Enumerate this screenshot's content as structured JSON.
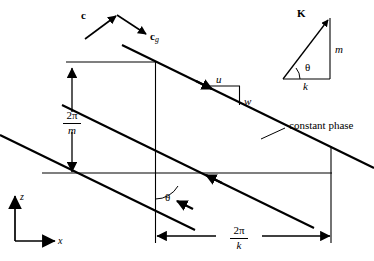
{
  "figure": {
    "background_color": "#ffffff",
    "line_color": "#000000",
    "width": 374,
    "height": 261
  },
  "labels": {
    "phase_velocity": "c",
    "group_velocity_base": "c",
    "group_velocity_sub": "g",
    "wavevector": "K",
    "vertical_wavenumber": "m",
    "horizontal_wavenumber": "k",
    "theta_triangle": "θ",
    "theta_main": "θ",
    "u_component": "u",
    "w_component": "w",
    "constant_phase": "constant phase",
    "axis_z": "z",
    "axis_x": "x",
    "vertical_wavelength_num": "2π",
    "vertical_wavelength_den": "m",
    "horizontal_wavelength_num": "2π",
    "horizontal_wavelength_den": "k"
  },
  "geometry": {
    "phase_line_slope_deg": -26,
    "theta_angle_deg": 26,
    "box_left_x": 155,
    "box_right_x": 331,
    "box_top_y": 62,
    "box_bottom_y": 173,
    "vertical_arrow_x": 72,
    "vertical_arrow_top_y": 67,
    "vertical_arrow_bottom_y": 173,
    "horizontal_arrow_y": 236
  }
}
